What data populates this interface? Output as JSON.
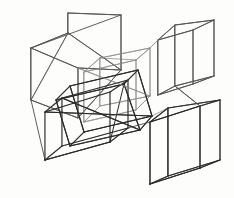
{
  "artwork": {
    "title": "Overlapping Wireframe Boxes",
    "medium": "pencil line drawing",
    "subject": "six transparent rectangular prisms in one-point and two-point perspective",
    "background_color": "#fdfdfc",
    "stroke_colors": {
      "dark": "#2b2b2b",
      "mid": "#555555",
      "light": "#8e8e8e",
      "faint": "#b3b3b3"
    },
    "canvas": {
      "width": 234,
      "height": 198
    }
  },
  "shapes": [
    {
      "name": "large-left-box",
      "weight": "mid",
      "vertices": {
        "ftl": [
          31,
          48
        ],
        "ftr": [
          78,
          68
        ],
        "fbr": [
          78,
          118
        ],
        "fbl": [
          31,
          100
        ],
        "btl": [
          68,
          13
        ],
        "btr": [
          121,
          15
        ],
        "bbr": [
          121,
          70
        ],
        "bbl": [
          68,
          33
        ]
      },
      "edges": [
        [
          31,
          48,
          78,
          68
        ],
        [
          78,
          68,
          78,
          118
        ],
        [
          78,
          118,
          31,
          100
        ],
        [
          31,
          100,
          31,
          48
        ],
        [
          68,
          13,
          121,
          15
        ],
        [
          121,
          15,
          121,
          70
        ],
        [
          121,
          70,
          68,
          33
        ],
        [
          68,
          33,
          68,
          13
        ],
        [
          31,
          48,
          68,
          33
        ],
        [
          78,
          68,
          121,
          70
        ],
        [
          78,
          118,
          121,
          70
        ],
        [
          31,
          100,
          68,
          33
        ]
      ]
    },
    {
      "name": "center-upper-box",
      "weight": "light",
      "edges": [
        [
          84,
          72,
          136,
          60
        ],
        [
          136,
          60,
          136,
          110
        ],
        [
          136,
          110,
          84,
          122
        ],
        [
          84,
          122,
          84,
          72
        ],
        [
          100,
          58,
          150,
          48
        ],
        [
          150,
          48,
          150,
          96
        ],
        [
          150,
          96,
          100,
          106
        ],
        [
          100,
          106,
          100,
          58
        ],
        [
          84,
          72,
          100,
          58
        ],
        [
          136,
          60,
          150,
          48
        ],
        [
          136,
          110,
          150,
          96
        ],
        [
          84,
          122,
          100,
          106
        ]
      ]
    },
    {
      "name": "center-lower-box",
      "weight": "dark",
      "edges": [
        [
          45,
          112,
          110,
          92
        ],
        [
          110,
          92,
          110,
          142
        ],
        [
          110,
          142,
          45,
          160
        ],
        [
          45,
          160,
          45,
          112
        ],
        [
          62,
          98,
          128,
          80
        ],
        [
          128,
          80,
          128,
          128
        ],
        [
          128,
          128,
          62,
          146
        ],
        [
          62,
          146,
          62,
          98
        ],
        [
          45,
          112,
          62,
          98
        ],
        [
          110,
          92,
          128,
          80
        ],
        [
          110,
          142,
          128,
          128
        ],
        [
          45,
          160,
          62,
          146
        ]
      ]
    },
    {
      "name": "center-diagonal-box",
      "weight": "dark",
      "edges": [
        [
          56,
          100,
          124,
          84
        ],
        [
          124,
          84,
          140,
          130
        ],
        [
          140,
          130,
          70,
          146
        ],
        [
          70,
          146,
          56,
          100
        ],
        [
          70,
          86,
          138,
          70
        ],
        [
          138,
          70,
          152,
          116
        ],
        [
          152,
          116,
          84,
          132
        ],
        [
          84,
          132,
          70,
          86
        ],
        [
          56,
          100,
          70,
          86
        ],
        [
          124,
          84,
          138,
          70
        ],
        [
          140,
          130,
          152,
          116
        ],
        [
          70,
          146,
          84,
          132
        ]
      ]
    },
    {
      "name": "tall-right-box",
      "weight": "mid",
      "edges": [
        [
          158,
          40,
          193,
          30
        ],
        [
          193,
          30,
          193,
          84
        ],
        [
          193,
          84,
          158,
          95
        ],
        [
          158,
          95,
          158,
          40
        ],
        [
          175,
          25,
          214,
          20
        ],
        [
          214,
          20,
          214,
          76
        ],
        [
          214,
          76,
          175,
          86
        ],
        [
          175,
          86,
          175,
          25
        ],
        [
          158,
          40,
          175,
          25
        ],
        [
          193,
          30,
          214,
          20
        ],
        [
          193,
          84,
          214,
          76
        ],
        [
          158,
          95,
          175,
          86
        ]
      ]
    },
    {
      "name": "bottom-right-box",
      "weight": "dark",
      "edges": [
        [
          150,
          122,
          200,
          106
        ],
        [
          200,
          106,
          200,
          168
        ],
        [
          200,
          168,
          150,
          184
        ],
        [
          150,
          184,
          150,
          122
        ],
        [
          168,
          108,
          220,
          100
        ],
        [
          220,
          100,
          220,
          160
        ],
        [
          220,
          160,
          168,
          176
        ],
        [
          168,
          176,
          168,
          108
        ],
        [
          150,
          122,
          168,
          108
        ],
        [
          200,
          106,
          220,
          100
        ],
        [
          200,
          168,
          220,
          160
        ],
        [
          150,
          184,
          168,
          176
        ]
      ]
    }
  ],
  "connector_lines": [
    {
      "name": "left-to-center-upper",
      "from": [
        78,
        68
      ],
      "to": [
        150,
        96
      ],
      "weight": "light"
    },
    {
      "name": "center-cross-a",
      "from": [
        45,
        112
      ],
      "to": [
        152,
        116
      ],
      "weight": "dark"
    },
    {
      "name": "center-cross-b",
      "from": [
        62,
        98
      ],
      "to": [
        140,
        130
      ],
      "weight": "dark"
    },
    {
      "name": "right-box-brace",
      "from": [
        175,
        86
      ],
      "to": [
        200,
        106
      ],
      "weight": "mid"
    },
    {
      "name": "upper-right-strut",
      "from": [
        150,
        48
      ],
      "to": [
        158,
        40
      ],
      "weight": "light"
    }
  ]
}
